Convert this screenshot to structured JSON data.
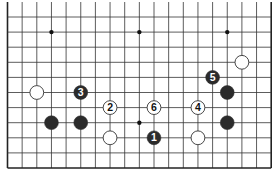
{
  "diagram": {
    "type": "go-board-fragment",
    "edges_visible": [
      "left",
      "bottom",
      "right"
    ],
    "columns": 19,
    "rows_visible": 11,
    "grid": {
      "x0": 7.5,
      "dx": 14.65,
      "y0": 17,
      "dy": 15.1,
      "line_color": "#333333",
      "edge_color": "#222222"
    },
    "star_points": [
      {
        "c": 3,
        "r": 1
      },
      {
        "c": 9,
        "r": 1
      },
      {
        "c": 15,
        "r": 1
      },
      {
        "c": 9,
        "r": 7
      }
    ],
    "stones": [
      {
        "color": "white",
        "c": 2,
        "r": 5,
        "label": ""
      },
      {
        "color": "black",
        "c": 5,
        "r": 5,
        "label": "3"
      },
      {
        "color": "white",
        "c": 7,
        "r": 6,
        "label": "2"
      },
      {
        "color": "black",
        "c": 3,
        "r": 7,
        "label": ""
      },
      {
        "color": "black",
        "c": 5,
        "r": 7,
        "label": ""
      },
      {
        "color": "white",
        "c": 7,
        "r": 8,
        "label": ""
      },
      {
        "color": "white",
        "c": 10,
        "r": 6,
        "label": "6"
      },
      {
        "color": "black",
        "c": 10,
        "r": 8,
        "label": "1"
      },
      {
        "color": "white",
        "c": 13,
        "r": 6,
        "label": "4"
      },
      {
        "color": "white",
        "c": 13,
        "r": 8,
        "label": ""
      },
      {
        "color": "black",
        "c": 14,
        "r": 4,
        "label": "5"
      },
      {
        "color": "black",
        "c": 15,
        "r": 5,
        "label": ""
      },
      {
        "color": "black",
        "c": 15,
        "r": 7,
        "label": ""
      },
      {
        "color": "white",
        "c": 16,
        "r": 3,
        "label": ""
      }
    ],
    "colors": {
      "black_stone": "#2b2b2b",
      "white_stone": "#ffffff",
      "white_outline": "#333333",
      "black_label": "#ffffff",
      "white_label": "#111111"
    }
  }
}
